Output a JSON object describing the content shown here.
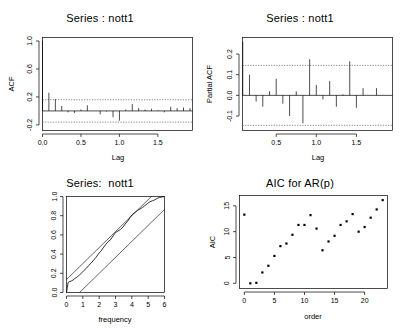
{
  "figure": {
    "width": 400,
    "height": 334,
    "background": "#ffffff",
    "foreground": "#000000",
    "dash_color": "#777777",
    "layout": "2x2 grid of R base-graphics diagnostic plots"
  },
  "panels": {
    "acf": {
      "title": "Series : nott1",
      "xlabel": "Lag",
      "ylabel": "ACF"
    },
    "pacf": {
      "title": "Series : nott1",
      "xlabel": "Lag",
      "ylabel": "Partial ACF"
    },
    "cpgram": {
      "title": "Series:  nott1",
      "xlabel": "frequency",
      "ylabel": ""
    },
    "aic": {
      "title": "AIC for AR(p)",
      "xlabel": "order",
      "ylabel": "AIC"
    }
  },
  "chart_data": [
    {
      "id": "acf",
      "type": "bar",
      "title": "Series : nott1",
      "xlabel": "Lag",
      "ylabel": "ACF",
      "xlim": [
        0.0,
        1.95
      ],
      "ylim": [
        -0.28,
        1.05
      ],
      "xticks": [
        0.0,
        0.5,
        1.0,
        1.5
      ],
      "xtick_labels": [
        "0.0",
        "0.5",
        "1.0",
        "1.5"
      ],
      "yticks": [
        -0.2,
        0.2,
        0.6,
        1.0
      ],
      "ytick_labels": [
        "-0.2",
        "0.2",
        "0.6",
        "1.0"
      ],
      "grid": false,
      "legend": "none",
      "confidence_bands": [
        0.16,
        -0.16
      ],
      "zero_line": 0.0,
      "x": [
        0.0,
        0.083,
        0.167,
        0.25,
        0.333,
        0.417,
        0.5,
        0.583,
        0.667,
        0.75,
        0.833,
        0.917,
        1.0,
        1.083,
        1.167,
        1.25,
        1.333,
        1.417,
        1.5,
        1.583,
        1.667,
        1.75,
        1.833,
        1.917
      ],
      "values": [
        1.0,
        0.26,
        0.17,
        0.07,
        -0.02,
        -0.03,
        0.02,
        0.08,
        0.0,
        -0.05,
        -0.01,
        -0.09,
        -0.14,
        0.02,
        0.1,
        0.04,
        0.02,
        0.03,
        0.01,
        -0.02,
        0.06,
        0.04,
        0.05,
        0.04
      ]
    },
    {
      "id": "pacf",
      "type": "bar",
      "title": "Series : nott1",
      "xlabel": "Lag",
      "ylabel": "Partial ACF",
      "xlim": [
        0.08,
        1.95
      ],
      "ylim": [
        -0.17,
        0.28
      ],
      "xticks": [
        0.5,
        1.0,
        1.5
      ],
      "xtick_labels": [
        "0.5",
        "1.0",
        "1.5"
      ],
      "yticks": [
        -0.1,
        0.0,
        0.1,
        0.2
      ],
      "ytick_labels": [
        "-0.1",
        "0.0",
        "0.1",
        "0.2"
      ],
      "grid": false,
      "legend": "none",
      "confidence_bands": [
        0.145,
        -0.145
      ],
      "zero_line": 0.0,
      "x": [
        0.083,
        0.167,
        0.25,
        0.333,
        0.417,
        0.5,
        0.583,
        0.667,
        0.75,
        0.833,
        0.917,
        1.0,
        1.083,
        1.167,
        1.25,
        1.333,
        1.417,
        1.5,
        1.583,
        1.667,
        1.75,
        1.833,
        1.917
      ],
      "values": [
        0.26,
        0.1,
        -0.03,
        -0.055,
        0.02,
        0.08,
        -0.04,
        -0.1,
        0.02,
        -0.135,
        0.175,
        0.05,
        -0.02,
        0.07,
        -0.055,
        0.005,
        0.165,
        -0.06,
        0.035,
        0.0,
        0.035,
        0.0,
        0.0
      ]
    },
    {
      "id": "cpgram",
      "type": "line",
      "title": "Series:  nott1",
      "xlabel": "frequency",
      "ylabel": "",
      "xlim": [
        0,
        6
      ],
      "ylim": [
        0.0,
        1.0
      ],
      "xticks": [
        0,
        1,
        2,
        3,
        4,
        5,
        6
      ],
      "xtick_labels": [
        "0",
        "1",
        "2",
        "3",
        "4",
        "5",
        "6"
      ],
      "yticks": [
        0.0,
        0.2,
        0.4,
        0.6,
        0.8,
        1.0
      ],
      "ytick_labels": [
        "0.0",
        "0.2",
        "0.4",
        "0.6",
        "0.8",
        "1.0"
      ],
      "grid": false,
      "legend": "none",
      "series": [
        {
          "name": "cumulative periodogram",
          "x": [
            0.0,
            0.1,
            0.2,
            0.3,
            0.4,
            0.5,
            0.6,
            0.75,
            0.9,
            1.05,
            1.2,
            1.35,
            1.5,
            1.65,
            1.8,
            1.95,
            2.1,
            2.25,
            2.4,
            2.55,
            2.7,
            2.85,
            3.0,
            3.15,
            3.3,
            3.45,
            3.6,
            3.75,
            3.9,
            4.05,
            4.2,
            4.35,
            4.5,
            4.65,
            4.8,
            4.95,
            5.1,
            5.25,
            5.4,
            5.55,
            5.7,
            5.85,
            6.0
          ],
          "values": [
            0.0,
            0.105,
            0.115,
            0.12,
            0.13,
            0.145,
            0.155,
            0.175,
            0.2,
            0.225,
            0.25,
            0.28,
            0.305,
            0.335,
            0.365,
            0.4,
            0.43,
            0.465,
            0.5,
            0.53,
            0.55,
            0.59,
            0.625,
            0.64,
            0.655,
            0.68,
            0.715,
            0.745,
            0.785,
            0.815,
            0.835,
            0.855,
            0.87,
            0.885,
            0.905,
            0.925,
            0.945,
            0.955,
            0.965,
            0.98,
            0.99,
            0.995,
            1.0
          ]
        },
        {
          "name": "upper confidence line",
          "x": [
            0,
            5.2
          ],
          "values": [
            0.135,
            1.0
          ]
        },
        {
          "name": "lower confidence line",
          "x": [
            0.8,
            6
          ],
          "values": [
            0.0,
            0.865
          ]
        }
      ]
    },
    {
      "id": "aic",
      "type": "scatter",
      "title": "AIC for AR(p)",
      "xlabel": "order",
      "ylabel": "AIC",
      "xlim": [
        -0.8,
        23.8
      ],
      "ylim": [
        -1.0,
        17.0
      ],
      "xticks": [
        0,
        5,
        10,
        15,
        20
      ],
      "xtick_labels": [
        "0",
        "5",
        "10",
        "15",
        "20"
      ],
      "yticks": [
        0,
        5,
        10,
        15
      ],
      "ytick_labels": [
        "0",
        "5",
        "10",
        "15"
      ],
      "grid": false,
      "legend": "none",
      "x": [
        0,
        1,
        2,
        3,
        4,
        5,
        6,
        7,
        8,
        9,
        10,
        11,
        12,
        13,
        14,
        15,
        16,
        17,
        18,
        19,
        20,
        21,
        22,
        23
      ],
      "values": [
        13.3,
        0.0,
        0.1,
        2.1,
        3.4,
        5.3,
        7.2,
        7.7,
        9.4,
        11.3,
        11.3,
        13.2,
        10.6,
        6.4,
        8.1,
        9.2,
        11.3,
        12.0,
        13.4,
        10.0,
        10.9,
        12.7,
        14.3,
        16.1
      ]
    }
  ]
}
